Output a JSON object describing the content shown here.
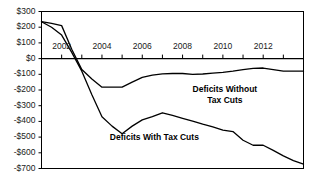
{
  "chart_data": {
    "type": "line",
    "title": "",
    "subtitle": "",
    "xlabel": "",
    "ylabel": "",
    "xlim": [
      2001,
      2014
    ],
    "ylim": [
      -700,
      300
    ],
    "grid": false,
    "legend_position": "inline-annotations",
    "y_ticks": [
      300,
      200,
      100,
      0,
      -100,
      -200,
      -300,
      -400,
      -500,
      -600,
      -700
    ],
    "y_tick_labels": [
      "$300",
      "$200",
      "$100",
      "$0",
      "-$100",
      "-$200",
      "-$300",
      "-$400",
      "-$500",
      "-$600",
      "-$700"
    ],
    "x_ticks": [
      2002,
      2004,
      2006,
      2008,
      2010,
      2012
    ],
    "x_tick_labels": [
      "2002",
      "2004",
      "2006",
      "2008",
      "2010",
      "2012"
    ],
    "x_minor_ticks": [
      2001,
      2002,
      2003,
      2004,
      2005,
      2006,
      2007,
      2008,
      2009,
      2010,
      2011,
      2012,
      2013,
      2014
    ],
    "x": [
      2001,
      2001.5,
      2002,
      2002.5,
      2003,
      2003.5,
      2004,
      2004.5,
      2005,
      2005.5,
      2006,
      2006.5,
      2007,
      2007.5,
      2008,
      2008.5,
      2009,
      2009.5,
      2010,
      2010.5,
      2011,
      2011.5,
      2012,
      2012.5,
      2013,
      2013.5,
      2014
    ],
    "series": [
      {
        "name": "Deficits Without Tax Cuts",
        "color": "#000000",
        "values": [
          235,
          225,
          210,
          60,
          -70,
          -130,
          -182,
          -182,
          -182,
          -150,
          -120,
          -105,
          -97,
          -95,
          -95,
          -100,
          -98,
          -93,
          -88,
          -80,
          -70,
          -62,
          -60,
          -70,
          -80,
          -80,
          -80
        ]
      },
      {
        "name": "Deficits With Tax Cuts",
        "color": "#000000",
        "values": [
          235,
          200,
          150,
          40,
          -80,
          -230,
          -370,
          -430,
          -478,
          -430,
          -390,
          -370,
          -345,
          -362,
          -380,
          -398,
          -418,
          -435,
          -455,
          -465,
          -520,
          -552,
          -552,
          -585,
          -620,
          -650,
          -672
        ]
      }
    ],
    "annotations": [
      {
        "text_line1": "Deficits Without",
        "text_line2": "Tax Cuts",
        "x": 2010.1,
        "y": -200
      },
      {
        "text_line1": "Deficits With Tax Cuts",
        "text_line2": "",
        "x": 2006.6,
        "y": -505
      }
    ]
  }
}
